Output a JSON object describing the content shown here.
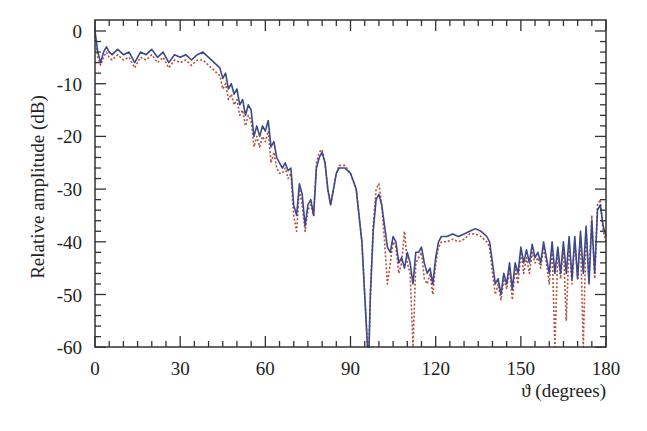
{
  "chart_data": {
    "type": "line",
    "title": "",
    "xlabel": "ϑ (degrees)",
    "ylabel": "Relative amplitude (dB)",
    "xlim": [
      0,
      180
    ],
    "ylim": [
      -60,
      0
    ],
    "x_ticks": [
      0,
      30,
      60,
      90,
      120,
      150,
      180
    ],
    "x_tick_labels": [
      "0",
      "30",
      "60",
      "90",
      "120",
      "150",
      "180"
    ],
    "x_minor_step": 5,
    "y_ticks": [
      0,
      -10,
      -20,
      -30,
      -40,
      -50,
      -60
    ],
    "y_tick_labels": [
      "0",
      "-10",
      "-20",
      "-30",
      "-40",
      "-50",
      "-60"
    ],
    "y_minor_step": 2,
    "grid": false,
    "legend": "none",
    "series": [
      {
        "name": "solid",
        "style": "solid",
        "color": "#3a4a8c",
        "x": [
          0,
          1,
          2,
          3,
          4,
          5,
          6,
          8,
          10,
          12,
          14,
          16,
          18,
          20,
          22,
          24,
          26,
          28,
          30,
          32,
          34,
          36,
          38,
          40,
          42,
          44,
          45,
          46,
          47,
          48,
          49,
          50,
          51,
          52,
          53,
          54,
          55,
          56,
          57,
          58,
          59,
          60,
          61,
          62,
          63,
          64,
          65,
          66,
          67,
          68,
          69,
          70,
          71,
          72,
          73,
          74,
          75,
          76,
          77,
          78,
          79,
          80,
          81,
          82,
          83,
          84,
          85,
          86,
          88,
          90,
          92,
          94,
          95,
          96,
          96.5,
          97,
          98,
          99,
          100,
          101,
          102,
          103,
          104,
          105,
          106,
          107,
          108,
          109,
          110,
          111,
          112,
          113,
          114,
          115,
          116,
          117,
          118,
          119,
          120,
          121,
          122,
          124,
          126,
          128,
          130,
          132,
          134,
          136,
          138,
          139,
          140,
          141,
          142,
          143,
          144,
          145,
          146,
          147,
          148,
          149,
          150,
          151,
          152,
          153,
          154,
          155,
          156,
          157,
          158,
          159,
          160,
          161,
          162,
          163,
          164,
          165,
          166,
          167,
          168,
          169,
          170,
          171,
          172,
          173,
          174,
          175,
          176,
          177,
          178,
          179,
          180
        ],
        "values": [
          0,
          -4,
          -6,
          -4,
          -3,
          -4,
          -4.5,
          -3.5,
          -4.5,
          -4,
          -6,
          -4,
          -4.5,
          -3.5,
          -5,
          -4,
          -6,
          -4.5,
          -5,
          -4.5,
          -5.5,
          -4.5,
          -4,
          -5,
          -6,
          -7,
          -9,
          -8,
          -11,
          -10,
          -12,
          -11,
          -14,
          -13,
          -16,
          -14,
          -15,
          -20,
          -18,
          -20,
          -18,
          -19,
          -17,
          -22,
          -21,
          -24,
          -25,
          -26,
          -25,
          -26.5,
          -26,
          -33,
          -35,
          -29,
          -31,
          -37,
          -33,
          -32,
          -35,
          -26,
          -24,
          -23,
          -25,
          -30,
          -33,
          -30,
          -27,
          -26,
          -26,
          -27,
          -30,
          -40,
          -50,
          -60,
          -60,
          -50,
          -38,
          -32,
          -31,
          -33,
          -37,
          -41,
          -42,
          -39,
          -40,
          -44,
          -43,
          -45,
          -42,
          -44,
          -48,
          -42,
          -42,
          -41,
          -44,
          -46,
          -45,
          -48,
          -43,
          -40,
          -39,
          -39,
          -38.5,
          -39,
          -38.5,
          -38,
          -37.5,
          -38,
          -39,
          -40,
          -44,
          -48,
          -47,
          -50,
          -46,
          -48,
          -44,
          -49,
          -44,
          -46,
          -41,
          -44,
          -41.5,
          -44,
          -40.5,
          -43,
          -42,
          -44,
          -40,
          -43,
          -46,
          -40,
          -46,
          -41,
          -46,
          -40,
          -46,
          -39,
          -47,
          -39,
          -47,
          -38,
          -46,
          -37,
          -48,
          -36,
          -46,
          -34,
          -33,
          -37,
          -39
        ],
        "note": "Estimated from pixels; dips near 96-97° reach below -60 dB"
      },
      {
        "name": "dotted",
        "style": "dotted",
        "color": "#b5503a",
        "x": [
          0,
          1,
          2,
          3,
          4,
          5,
          6,
          8,
          10,
          12,
          14,
          16,
          18,
          20,
          22,
          24,
          26,
          28,
          30,
          32,
          34,
          36,
          38,
          40,
          42,
          44,
          45,
          46,
          47,
          48,
          49,
          50,
          51,
          52,
          53,
          54,
          55,
          56,
          57,
          58,
          59,
          60,
          61,
          62,
          63,
          64,
          65,
          66,
          67,
          68,
          69,
          70,
          71,
          72,
          73,
          74,
          75,
          76,
          77,
          78,
          79,
          80,
          81,
          82,
          83,
          84,
          85,
          86,
          88,
          90,
          92,
          94,
          95,
          96,
          96.5,
          97,
          98,
          99,
          100,
          101,
          102,
          103,
          104,
          105,
          106,
          107,
          108,
          109,
          110,
          111,
          112,
          113,
          114,
          115,
          116,
          117,
          118,
          119,
          120,
          121,
          122,
          124,
          126,
          128,
          130,
          132,
          134,
          136,
          138,
          139,
          140,
          141,
          142,
          143,
          144,
          145,
          146,
          147,
          148,
          149,
          150,
          151,
          152,
          153,
          154,
          155,
          156,
          157,
          158,
          159,
          160,
          161,
          162,
          163,
          164,
          165,
          166,
          167,
          168,
          169,
          170,
          171,
          172,
          173,
          174,
          175,
          176,
          177,
          178,
          179,
          180
        ],
        "values": [
          -1,
          -5,
          -6.5,
          -5,
          -4,
          -5,
          -5.5,
          -4.5,
          -5.5,
          -5,
          -7,
          -5,
          -5.5,
          -4.5,
          -6,
          -5,
          -7,
          -5.5,
          -6,
          -5.5,
          -6.5,
          -5.5,
          -5.5,
          -6.5,
          -7.5,
          -8.5,
          -11,
          -10,
          -13,
          -12,
          -14,
          -13,
          -16,
          -15,
          -18,
          -16,
          -17,
          -22,
          -20,
          -22,
          -20,
          -21,
          -19,
          -25,
          -23,
          -26,
          -27,
          -27,
          -26,
          -28,
          -27,
          -35,
          -38,
          -30,
          -33,
          -38,
          -34,
          -33,
          -35,
          -25,
          -23,
          -22.5,
          -25,
          -30,
          -33,
          -30,
          -27,
          -25.5,
          -25.5,
          -27,
          -30,
          -40,
          -50,
          -60,
          -60,
          -50,
          -37,
          -30,
          -29,
          -33,
          -40,
          -48,
          -44,
          -40,
          -41,
          -46,
          -44,
          -38,
          -44,
          -46,
          -60,
          -44,
          -43,
          -42,
          -47,
          -48,
          -46,
          -50,
          -44,
          -41,
          -40,
          -40,
          -39.5,
          -40,
          -39.5,
          -38.5,
          -38.5,
          -39,
          -40,
          -41,
          -46,
          -50,
          -48,
          -51,
          -47,
          -49,
          -45,
          -51,
          -45,
          -48,
          -42,
          -46,
          -43,
          -46,
          -42,
          -44,
          -43,
          -45,
          -41,
          -44,
          -48,
          -41,
          -60,
          -42,
          -47,
          -41,
          -55,
          -40,
          -48,
          -40,
          -47,
          -39,
          -60,
          -38,
          -47,
          -35,
          -47,
          -33,
          -32,
          -38,
          -40
        ]
      }
    ]
  },
  "plot_area": {
    "left": 95,
    "top": 20,
    "right": 606,
    "bottom": 347,
    "y_zero_px": 31,
    "px_per_dB": 5.27,
    "px_per_deg": 2.839
  }
}
